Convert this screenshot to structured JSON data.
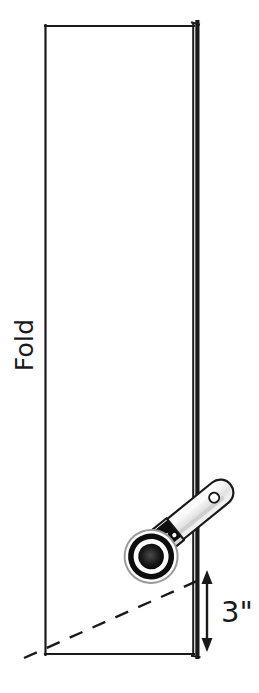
{
  "diagram": {
    "type": "sewing-instruction-illustration",
    "background_color": "#ffffff",
    "ink_color": "#1a1a1a",
    "labels": {
      "fold": "Fold",
      "measurement": "3\""
    },
    "fabric": {
      "name": "folded-fabric-rectangle",
      "left_x": 45,
      "right_x": 197,
      "top_y": 25,
      "bottom_y": 655,
      "fold_edge_side": "right",
      "outline_color": "#1a1a1a",
      "fill_color": "#ffffff"
    },
    "cut_line": {
      "name": "diagonal-cut-line",
      "style": "dashed",
      "from": [
        25,
        657
      ],
      "to": [
        205,
        578
      ],
      "color": "#1a1a1a"
    },
    "dimension": {
      "name": "three-inch-dimension",
      "value": "3\"",
      "arrow_x": 207,
      "arrow_top_y": 573,
      "arrow_bottom_y": 648,
      "double_headed": true,
      "color": "#1a1a1a"
    },
    "tool": {
      "name": "rotary-cutter",
      "handle_color": "#f0f0f0",
      "handle_outline": "#1a1a1a",
      "blade_color": "#0d0d0d",
      "blade_ring_color": "#ffffff",
      "hole_color": "#ffffff",
      "angle_degrees": -40
    }
  }
}
